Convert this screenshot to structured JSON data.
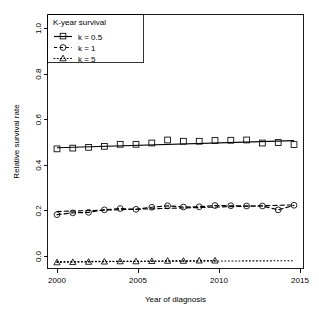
{
  "chart_data": {
    "type": "line",
    "title": "",
    "xlabel": "Year of diagnosis",
    "ylabel": "Relative survival rate",
    "xlim": [
      1999.4,
      2015.6
    ],
    "ylim": [
      0.0,
      1.0
    ],
    "xticks": [
      2000,
      2005,
      2010,
      2015
    ],
    "yticks": [
      0.0,
      0.2,
      0.4,
      0.6,
      0.8,
      1.0
    ],
    "ytick_labels": [
      "0.0",
      "0.2",
      "0.4",
      "0.6",
      "0.8",
      "1.0"
    ],
    "xtick_labels": [
      "2000",
      "2005",
      "2010",
      "2015"
    ],
    "grid": false,
    "legend_title": "K-year survival",
    "legend_position": "top-left",
    "x": [
      2000,
      2001,
      2002,
      2003,
      2004,
      2005,
      2006,
      2007,
      2008,
      2009,
      2010,
      2011,
      2012,
      2013,
      2014,
      2015
    ],
    "series": [
      {
        "name": "k = 0.5",
        "marker": "square",
        "linetype": "solid",
        "values": [
          0.471,
          0.474,
          0.477,
          0.481,
          0.489,
          0.489,
          0.494,
          0.506,
          0.501,
          0.501,
          0.504,
          0.505,
          0.506,
          0.494,
          0.496,
          0.488
        ],
        "trend": {
          "start_year": 2000,
          "start_value": 0.4755,
          "end_year": 2015,
          "end_value": 0.5035
        }
      },
      {
        "name": "k = 1",
        "marker": "circle",
        "linetype": "dashed",
        "values": [
          0.212,
          0.219,
          0.221,
          0.231,
          0.236,
          0.233,
          0.241,
          0.247,
          0.242,
          0.243,
          0.248,
          0.247,
          0.246,
          0.246,
          0.231,
          0.249
        ],
        "trend": {
          "start_year": 2000,
          "start_value": 0.2245,
          "end_year": 2015,
          "end_value": 0.2505
        }
      },
      {
        "name": "k = 5",
        "marker": "triangle",
        "linetype": "dotted",
        "values": [
          0.024,
          0.025,
          0.026,
          0.027,
          0.028,
          0.028,
          0.029,
          0.03,
          0.03,
          0.031,
          0.031,
          null,
          null,
          null,
          null,
          null
        ],
        "trend": {
          "start_year": 2000,
          "start_value": 0.0275,
          "end_year": 2015,
          "end_value": 0.0305
        }
      }
    ]
  },
  "legend": {
    "title": "K-year survival",
    "entries": [
      {
        "label": "k = 0.5",
        "icon": "square-marker-solid-line-icon"
      },
      {
        "label": "k = 1",
        "icon": "circle-marker-dashed-line-icon"
      },
      {
        "label": "k = 5",
        "icon": "triangle-marker-dotted-line-icon"
      }
    ]
  },
  "colors": {
    "foreground": "#000000",
    "background": "#ffffff"
  }
}
